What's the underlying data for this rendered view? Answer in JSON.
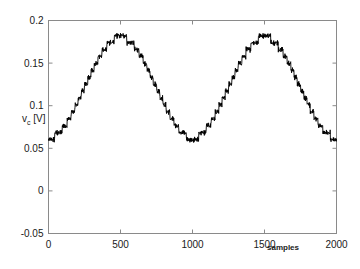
{
  "figure": {
    "background_color": "#ffffff",
    "axis_color": "#8a8a8a",
    "line_color": "#000000"
  },
  "axis": {
    "y_label_main": "v",
    "y_label_sub": "c",
    "y_label_unit": " [V]",
    "x_label": "samples",
    "y_ticks": [
      "-0.05",
      "0",
      "0.05",
      "0.1",
      "0.15",
      "0.2"
    ],
    "x_ticks": [
      "0",
      "500",
      "1000",
      "1500",
      "2000"
    ]
  },
  "chart_data": {
    "type": "line",
    "title": "",
    "xlabel": "samples",
    "ylabel": "v_c [V]",
    "xlim": [
      0,
      2000
    ],
    "ylim": [
      -0.05,
      0.2
    ],
    "grid": false,
    "legend": null,
    "y_tick_values": [
      -0.05,
      0,
      0.05,
      0.1,
      0.15,
      0.2
    ],
    "x_tick_values": [
      0,
      500,
      1000,
      1500,
      2000
    ],
    "series": [
      {
        "name": "v_c",
        "x": [
          0,
          40,
          40,
          100,
          100,
          150,
          150,
          200,
          200,
          255,
          255,
          310,
          310,
          370,
          370,
          420,
          420,
          480,
          480,
          650,
          650,
          700,
          700,
          755,
          755,
          810,
          810,
          865,
          865,
          920,
          920,
          970,
          970,
          1035,
          1035,
          1150,
          1150,
          1200,
          1200,
          1255,
          1255,
          1310,
          1310,
          1365,
          1365,
          1420,
          1420,
          1475,
          1475,
          1530,
          1530,
          1700,
          1700,
          1755,
          1755,
          1810,
          1810,
          1865,
          1865,
          1920,
          1920,
          1965,
          1965,
          2000
        ],
        "y": [
          0.062,
          0.062,
          0.073,
          0.073,
          0.093,
          0.093,
          0.092,
          0.092,
          0.106,
          0.106,
          0.122,
          0.122,
          0.133,
          0.133,
          0.15,
          0.15,
          0.163,
          0.163,
          0.18,
          0.18,
          0.163,
          0.163,
          0.158,
          0.158,
          0.146,
          0.146,
          0.133,
          0.133,
          0.121,
          0.121,
          0.103,
          0.103,
          0.093,
          0.093,
          0.062,
          0.062,
          0.062,
          0.062,
          0.074,
          0.074,
          0.093,
          0.093,
          0.092,
          0.092,
          0.107,
          0.107,
          0.122,
          0.122,
          0.135,
          0.135,
          0.152,
          0.152,
          0.18,
          0.18,
          0.163,
          0.163,
          0.158,
          0.158,
          0.146,
          0.146,
          0.12,
          0.12,
          0.1,
          0.1
        ]
      }
    ],
    "waveform_model": {
      "sample_count": 2000,
      "cycles": 2,
      "mean": 0.121,
      "amplitude": 0.059,
      "quantization_levels": 16,
      "ripple_amplitude": 0.0035,
      "min_value": 0.06,
      "max_value": 0.182
    }
  }
}
